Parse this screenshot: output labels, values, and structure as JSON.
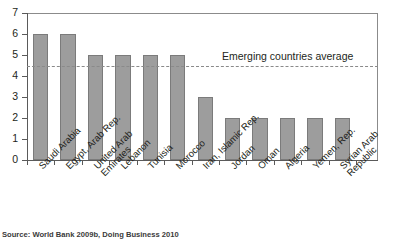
{
  "chart_data": {
    "type": "bar",
    "title": "",
    "xlabel": "",
    "ylabel": "",
    "ylim": [
      0,
      7
    ],
    "yticks": [
      "0",
      "1",
      "2",
      "3",
      "4",
      "5",
      "6",
      "7"
    ],
    "grid": false,
    "legend_position": "none",
    "categories": [
      "Saudi Arabia",
      "Egypt, Arab Rep.",
      "United Arab Emirates",
      "Lebanon",
      "Tunisia",
      "Morocco",
      "Iran, Islamic Rep.",
      "Jordan",
      "Oman",
      "Algeria",
      "Yemen, Rep.",
      "Syrian Arab Republic"
    ],
    "category_label_lines": [
      [
        "Saudi Arabia"
      ],
      [
        "Egypt, Arab Rep."
      ],
      [
        "United Arab",
        "Emirates"
      ],
      [
        "Lebanon"
      ],
      [
        "Tunisia"
      ],
      [
        "Morocco"
      ],
      [
        "Iran, Islamic Rep."
      ],
      [
        "Jordan"
      ],
      [
        "Oman"
      ],
      [
        "Algeria"
      ],
      [
        "Yemen, Rep."
      ],
      [
        "Syrian Arab",
        "Republic"
      ]
    ],
    "values": [
      6,
      6,
      5,
      5,
      5,
      5,
      3,
      2,
      2,
      2,
      2,
      2
    ],
    "annotations": [
      {
        "type": "hline",
        "label": "Emerging countries average",
        "value": 4.5,
        "style": "dashed"
      }
    ],
    "colors": {
      "bar_fill": "#9d9d9d",
      "bar_stroke": "#7b7b7b",
      "axis": "#5a5a5a",
      "frame": "#8b8b8b",
      "avg_line": "#8a8a8a",
      "text": "#231f20",
      "background": "#ffffff"
    }
  },
  "source": {
    "note": "Source: World Bank 2009b, Doing Business 2010"
  }
}
